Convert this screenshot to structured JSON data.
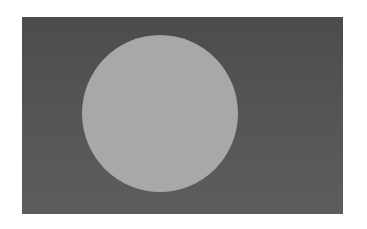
{
  "image": {
    "description": "Grayscale image of a large light-gray circle placed left of center on a dark-gray rectangular field",
    "colors": {
      "page_background": "#ffffff",
      "field": "#555555",
      "circle": "#a8a8a8"
    },
    "shapes": [
      {
        "type": "rectangle",
        "name": "field",
        "x": 22,
        "y": 17,
        "width": 321,
        "height": 197
      },
      {
        "type": "circle",
        "name": "disc",
        "cx": 160,
        "cy": 113,
        "r": 78
      }
    ]
  }
}
